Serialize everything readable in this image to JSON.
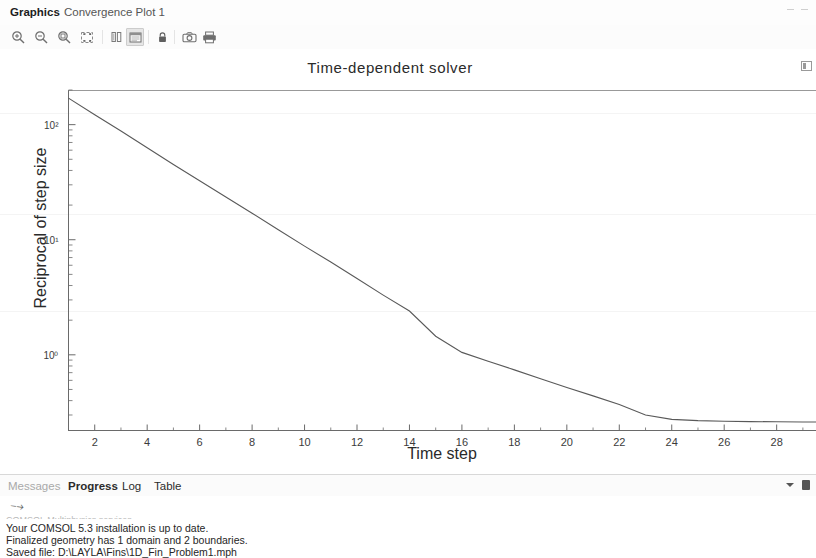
{
  "window": {
    "tabs": [
      {
        "label": "Graphics",
        "active": true
      },
      {
        "label": "Convergence Plot 1",
        "active": false
      }
    ]
  },
  "toolbar": {
    "buttons": [
      {
        "icon": "zoom-in-icon",
        "label": "Zoom In"
      },
      {
        "icon": "zoom-out-icon",
        "label": "Zoom Out"
      },
      {
        "icon": "zoom-box-icon",
        "label": "Zoom Box"
      },
      {
        "icon": "zoom-extents-icon",
        "label": "Zoom Extents"
      },
      {
        "icon": "plot-columns-icon",
        "label": "Transparency"
      },
      {
        "icon": "plot-image-icon",
        "label": "Scene Light",
        "pressed": true
      },
      {
        "icon": "lock-icon",
        "label": "Lock Axis"
      },
      {
        "icon": "camera-icon",
        "label": "Image Snapshot"
      },
      {
        "icon": "print-icon",
        "label": "Print"
      }
    ]
  },
  "chart_data": {
    "type": "line",
    "title": "Time-dependent solver",
    "xlabel": "Time step",
    "ylabel": "Reciprocal of step size",
    "yscale": "log",
    "xlim": [
      1,
      29.5
    ],
    "ylim": [
      0.22,
      200
    ],
    "xticks": [
      2,
      4,
      6,
      8,
      10,
      12,
      14,
      16,
      18,
      20,
      22,
      24,
      26,
      28
    ],
    "yticks": [
      1,
      10,
      100
    ],
    "ytick_labels": [
      "10⁰",
      "10¹",
      "10²"
    ],
    "grid": false,
    "legend": "none",
    "line_color": "#595959",
    "series": [
      {
        "name": "Reciprocal of step size",
        "x": [
          1,
          2,
          3,
          4,
          5,
          6,
          7,
          8,
          9,
          10,
          11,
          12,
          13,
          14,
          15,
          16,
          17,
          18,
          19,
          20,
          21,
          22,
          23,
          24,
          25,
          26,
          27,
          28,
          29,
          29.5
        ],
        "y": [
          170,
          122,
          88,
          63,
          45,
          32.5,
          23.5,
          17.0,
          12.2,
          8.8,
          6.4,
          4.6,
          3.3,
          2.4,
          1.45,
          1.05,
          0.88,
          0.74,
          0.62,
          0.52,
          0.44,
          0.37,
          0.3,
          0.275,
          0.268,
          0.265,
          0.263,
          0.262,
          0.261,
          0.261
        ]
      }
    ]
  },
  "bottom_panel": {
    "tabs": [
      {
        "label": "Messages",
        "active": false
      },
      {
        "label": "Progress",
        "active": true
      },
      {
        "label": "Log",
        "active": false
      },
      {
        "label": "Table",
        "active": false
      }
    ],
    "log_lines": [
      "COMSOL Multiphysics services",
      "Your COMSOL 5.3 installation is up to date.",
      "Finalized geometry has 1 domain and 2 boundaries.",
      "Saved file: D:\\LAYLA\\Fins\\1D_Fin_Problem1.mph"
    ]
  }
}
